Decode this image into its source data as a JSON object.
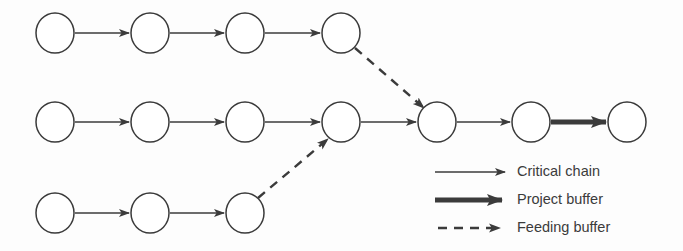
{
  "figure": {
    "kind": "critical-chain-network-diagram",
    "background_color": "#fdfdfd",
    "stroke_color": "#3b3b3b",
    "node_fill": "#ffffff",
    "width": 683,
    "height": 251
  },
  "nodes": [
    {
      "id": "t1",
      "chain": "feeding-top",
      "index": 1,
      "cx": 55,
      "cy": 33,
      "rx": 19,
      "ry": 20
    },
    {
      "id": "t2",
      "chain": "feeding-top",
      "index": 2,
      "cx": 150,
      "cy": 33,
      "rx": 19,
      "ry": 20
    },
    {
      "id": "t3",
      "chain": "feeding-top",
      "index": 3,
      "cx": 245,
      "cy": 33,
      "rx": 19,
      "ry": 20
    },
    {
      "id": "t4",
      "chain": "feeding-top",
      "index": 4,
      "cx": 341,
      "cy": 33,
      "rx": 19,
      "ry": 20
    },
    {
      "id": "m1",
      "chain": "critical",
      "index": 1,
      "cx": 55,
      "cy": 122,
      "rx": 19,
      "ry": 20
    },
    {
      "id": "m2",
      "chain": "critical",
      "index": 2,
      "cx": 150,
      "cy": 122,
      "rx": 19,
      "ry": 20
    },
    {
      "id": "m3",
      "chain": "critical",
      "index": 3,
      "cx": 245,
      "cy": 122,
      "rx": 19,
      "ry": 20
    },
    {
      "id": "m4",
      "chain": "critical",
      "index": 4,
      "cx": 341,
      "cy": 122,
      "rx": 19,
      "ry": 20
    },
    {
      "id": "m5",
      "chain": "critical",
      "index": 5,
      "cx": 437,
      "cy": 122,
      "rx": 19,
      "ry": 20
    },
    {
      "id": "m6",
      "chain": "critical",
      "index": 6,
      "cx": 531,
      "cy": 122,
      "rx": 19,
      "ry": 20
    },
    {
      "id": "m7",
      "chain": "critical",
      "index": 7,
      "cx": 627,
      "cy": 122,
      "rx": 19,
      "ry": 20
    },
    {
      "id": "b1",
      "chain": "feeding-bottom",
      "index": 1,
      "cx": 55,
      "cy": 213,
      "rx": 19,
      "ry": 20
    },
    {
      "id": "b2",
      "chain": "feeding-bottom",
      "index": 2,
      "cx": 150,
      "cy": 213,
      "rx": 19,
      "ry": 20
    },
    {
      "id": "b3",
      "chain": "feeding-bottom",
      "index": 3,
      "cx": 245,
      "cy": 213,
      "rx": 19,
      "ry": 20
    }
  ],
  "edges": [
    {
      "id": "e-t1-t2",
      "from": "t1",
      "to": "t2",
      "style": "critical-chain",
      "x1": 75,
      "y1": 33,
      "x2": 129,
      "y2": 33
    },
    {
      "id": "e-t2-t3",
      "from": "t2",
      "to": "t3",
      "style": "critical-chain",
      "x1": 170,
      "y1": 33,
      "x2": 224,
      "y2": 33
    },
    {
      "id": "e-t3-t4",
      "from": "t3",
      "to": "t4",
      "style": "critical-chain",
      "x1": 265,
      "y1": 33,
      "x2": 320,
      "y2": 33
    },
    {
      "id": "e-t4-m5",
      "from": "t4",
      "to": "m5",
      "style": "feeding-buffer",
      "x1": 355,
      "y1": 48,
      "x2": 424,
      "y2": 108
    },
    {
      "id": "e-m1-m2",
      "from": "m1",
      "to": "m2",
      "style": "critical-chain",
      "x1": 75,
      "y1": 122,
      "x2": 129,
      "y2": 122
    },
    {
      "id": "e-m2-m3",
      "from": "m2",
      "to": "m3",
      "style": "critical-chain",
      "x1": 170,
      "y1": 122,
      "x2": 224,
      "y2": 122
    },
    {
      "id": "e-m3-m4",
      "from": "m3",
      "to": "m4",
      "style": "critical-chain",
      "x1": 265,
      "y1": 122,
      "x2": 320,
      "y2": 122
    },
    {
      "id": "e-m4-m5",
      "from": "m4",
      "to": "m5",
      "style": "critical-chain",
      "x1": 361,
      "y1": 122,
      "x2": 416,
      "y2": 122
    },
    {
      "id": "e-m5-m6",
      "from": "m5",
      "to": "m6",
      "style": "critical-chain",
      "x1": 457,
      "y1": 122,
      "x2": 510,
      "y2": 122
    },
    {
      "id": "e-m6-m7",
      "from": "m6",
      "to": "m7",
      "style": "project-buffer",
      "x1": 551,
      "y1": 122,
      "x2": 606,
      "y2": 122
    },
    {
      "id": "e-b1-b2",
      "from": "b1",
      "to": "b2",
      "style": "critical-chain",
      "x1": 75,
      "y1": 213,
      "x2": 129,
      "y2": 213
    },
    {
      "id": "e-b2-b3",
      "from": "b2",
      "to": "b3",
      "style": "critical-chain",
      "x1": 170,
      "y1": 213,
      "x2": 224,
      "y2": 213
    },
    {
      "id": "e-b3-m4",
      "from": "b3",
      "to": "m4",
      "style": "feeding-buffer",
      "x1": 258,
      "y1": 198,
      "x2": 328,
      "y2": 139
    }
  ],
  "legend": {
    "position": "bottom-right",
    "items": [
      {
        "id": "critical-chain",
        "label": "Critical chain",
        "line_style": "solid",
        "line_width": 1.6,
        "sample": {
          "x1": 435,
          "y1": 172,
          "x2": 505,
          "y2": 172
        },
        "label_x": 517,
        "label_y": 172
      },
      {
        "id": "project-buffer",
        "label": "Project buffer",
        "line_style": "solid-thick",
        "line_width": 5,
        "sample": {
          "x1": 435,
          "y1": 200,
          "x2": 502,
          "y2": 200
        },
        "label_x": 517,
        "label_y": 200
      },
      {
        "id": "feeding-buffer",
        "label": "Feeding buffer",
        "line_style": "dashed",
        "line_width": 2.4,
        "dash_pattern": "9 7",
        "sample": {
          "x1": 438,
          "y1": 228,
          "x2": 500,
          "y2": 228
        },
        "label_x": 517,
        "label_y": 228
      }
    ]
  }
}
